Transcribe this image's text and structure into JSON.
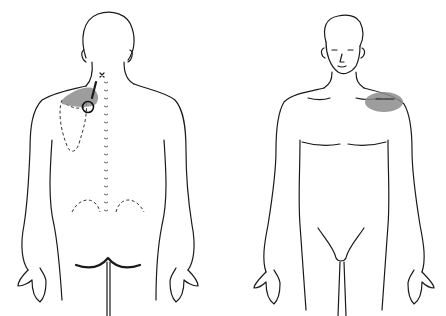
{
  "figure": {
    "type": "trigger-point-referral-diagram",
    "views": [
      {
        "id": "posterior",
        "label": "Back view"
      },
      {
        "id": "anterior",
        "label": "Front view"
      }
    ],
    "colors": {
      "line": "#1a1a1a",
      "referral_zone": "#8c8c8c",
      "background": "#ffffff"
    },
    "markers": {
      "trigger_point": "circle-marker",
      "primary_x": "x-marker"
    },
    "caption": ""
  }
}
